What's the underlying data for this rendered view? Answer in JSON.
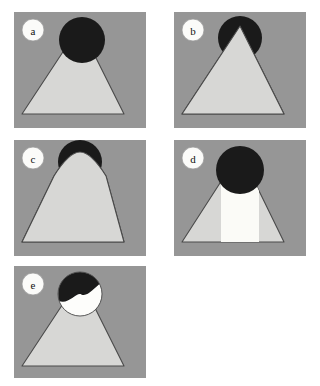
{
  "figure": {
    "title": "",
    "caption": "",
    "background_color": "#ffffff",
    "width": 320,
    "height": 386,
    "layout": "2-column grid, 5 panels (a,b across top; c,d middle; e bottom-left)"
  },
  "colors": {
    "panel_background": "#969696",
    "cone_fill": "#d7d7d5",
    "cone_outline": "#4a4a4a",
    "dark_cap": "#1a1a1a",
    "white_fill": "#fdfdfb",
    "label_badge_fill": "#fbfbf9",
    "label_badge_stroke": "#9a9a9a",
    "label_text": "#111111",
    "band_light": "#fbfbf7"
  },
  "panels": [
    {
      "id": "a",
      "label": "a",
      "description": "Cone with large dark spherical cap fully overlapping the apex",
      "x": 14,
      "y": 12,
      "w": 132,
      "h": 116,
      "label_pos": {
        "cx": 33,
        "cy": 30,
        "r": 11
      },
      "cone": {
        "apex_x": 80,
        "apex_y": 26,
        "base_left_x": 22,
        "base_right_x": 124,
        "base_y": 114,
        "apex_round": 0
      },
      "sphere": {
        "cx": 82,
        "cy": 40,
        "r": 23,
        "fill": "dark",
        "clip": "none"
      },
      "band": null
    },
    {
      "id": "b",
      "label": "b",
      "description": "Cone with dark cap clipped by the cone surface, visible only above the cone flanks",
      "x": 174,
      "y": 12,
      "w": 132,
      "h": 116,
      "label_pos": {
        "cx": 193,
        "cy": 30,
        "r": 11
      },
      "cone": {
        "apex_x": 240,
        "apex_y": 26,
        "base_left_x": 182,
        "base_right_x": 284,
        "base_y": 114,
        "apex_round": 0
      },
      "sphere": {
        "cx": 240,
        "cy": 38,
        "r": 22,
        "fill": "dark",
        "clip": "above-cone"
      },
      "band": null
    },
    {
      "id": "c",
      "label": "c",
      "description": "Cone with rounded apex and a thin dark crescent cap at the summit",
      "x": 14,
      "y": 140,
      "w": 132,
      "h": 116,
      "label_pos": {
        "cx": 33,
        "cy": 158,
        "r": 11
      },
      "cone": {
        "apex_x": 80,
        "apex_y": 152,
        "base_left_x": 22,
        "base_right_x": 124,
        "base_y": 242,
        "apex_round": 26
      },
      "sphere": {
        "cx": 80,
        "cy": 162,
        "r": 22,
        "fill": "dark",
        "clip": "thin-crescent"
      },
      "band": null
    },
    {
      "id": "d",
      "label": "d",
      "description": "Cone with large dark spherical cap and a bright vertical band down the centre",
      "x": 174,
      "y": 140,
      "w": 132,
      "h": 116,
      "label_pos": {
        "cx": 193,
        "cy": 158,
        "r": 11
      },
      "cone": {
        "apex_x": 240,
        "apex_y": 152,
        "base_left_x": 182,
        "base_right_x": 284,
        "base_y": 242,
        "apex_round": 0
      },
      "sphere": {
        "cx": 240,
        "cy": 170,
        "r": 24,
        "fill": "dark",
        "clip": "none"
      },
      "band": {
        "left_x": 221,
        "right_x": 259,
        "top_y": 152,
        "bottom_y": 242
      }
    },
    {
      "id": "e",
      "label": "e",
      "description": "Cone with a sphere at the apex split by a wavy line: dark upper-right, white lower-left",
      "x": 14,
      "y": 266,
      "w": 132,
      "h": 112,
      "label_pos": {
        "cx": 33,
        "cy": 284,
        "r": 11
      },
      "cone": {
        "apex_x": 80,
        "apex_y": 278,
        "base_left_x": 22,
        "base_right_x": 124,
        "base_y": 366,
        "apex_round": 0
      },
      "sphere": {
        "cx": 80,
        "cy": 294,
        "r": 22,
        "fill": "split-dark-white",
        "clip": "none"
      },
      "band": null
    }
  ]
}
